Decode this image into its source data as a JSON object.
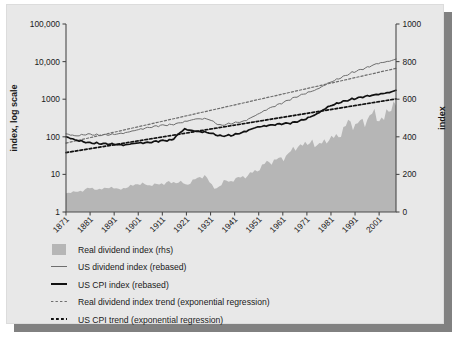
{
  "chart_data": {
    "type": "line",
    "title": "",
    "subtitle": "",
    "ylabel": "index, log scale",
    "ylabel_right": "index",
    "xlabel": "",
    "grid": false,
    "legend_position": "below",
    "y_log": true,
    "ylim": [
      1,
      100000
    ],
    "ytick_labels": [
      "100,000",
      "10,000",
      "1000",
      "100",
      "10",
      "1"
    ],
    "ytick_values": [
      100000,
      10000,
      1000,
      100,
      10,
      1
    ],
    "ylim_right": [
      0,
      1000
    ],
    "ytick_labels_right": [
      "1000",
      "800",
      "600",
      "400",
      "200",
      "0"
    ],
    "ytick_values_right": [
      1000,
      800,
      600,
      400,
      200,
      0
    ],
    "xlim": [
      1871,
      2008
    ],
    "xtick_labels": [
      "1871",
      "1881",
      "1891",
      "1901",
      "1911",
      "1921",
      "1931",
      "1941",
      "1951",
      "1961",
      "1971",
      "1981",
      "1991",
      "2001"
    ],
    "xtick_values": [
      1871,
      1881,
      1891,
      1901,
      1911,
      1921,
      1931,
      1941,
      1951,
      1961,
      1971,
      1981,
      1991,
      2001
    ],
    "series": [
      {
        "name": "Real dividend index (rhs)",
        "type": "area",
        "axis": "right",
        "color": "#b6b6b6",
        "x": [
          1871,
          1873,
          1875,
          1877,
          1879,
          1881,
          1883,
          1885,
          1887,
          1889,
          1891,
          1893,
          1895,
          1897,
          1899,
          1901,
          1903,
          1905,
          1907,
          1909,
          1911,
          1913,
          1915,
          1917,
          1919,
          1921,
          1923,
          1925,
          1927,
          1929,
          1931,
          1933,
          1935,
          1937,
          1939,
          1941,
          1943,
          1945,
          1947,
          1949,
          1951,
          1953,
          1955,
          1957,
          1959,
          1961,
          1963,
          1965,
          1967,
          1969,
          1971,
          1973,
          1975,
          1977,
          1979,
          1981,
          1983,
          1985,
          1987,
          1989,
          1991,
          1993,
          1995,
          1997,
          1999,
          2001,
          2003,
          2005,
          2007
        ],
        "values": [
          100,
          108,
          104,
          112,
          120,
          128,
          124,
          118,
          126,
          132,
          128,
          120,
          126,
          134,
          142,
          152,
          148,
          140,
          150,
          142,
          152,
          160,
          150,
          164,
          158,
          140,
          164,
          176,
          184,
          196,
          150,
          120,
          140,
          170,
          158,
          176,
          182,
          188,
          200,
          210,
          232,
          248,
          268,
          272,
          278,
          288,
          304,
          330,
          348,
          360,
          356,
          382,
          346,
          368,
          380,
          392,
          396,
          420,
          452,
          482,
          462,
          470,
          486,
          508,
          520,
          500,
          492,
          540,
          580
        ]
      },
      {
        "name": "US dividend index (rebased)",
        "type": "line",
        "axis": "left",
        "color": "#6e6e6e",
        "style": "solid",
        "width": 1,
        "x": [
          1871,
          1875,
          1880,
          1885,
          1890,
          1895,
          1900,
          1905,
          1910,
          1915,
          1920,
          1925,
          1930,
          1935,
          1940,
          1945,
          1950,
          1955,
          1960,
          1965,
          1970,
          1975,
          1980,
          1985,
          1990,
          1995,
          2000,
          2005,
          2008
        ],
        "values": [
          120,
          105,
          118,
          110,
          115,
          125,
          150,
          175,
          200,
          210,
          250,
          300,
          300,
          200,
          230,
          260,
          380,
          560,
          760,
          1050,
          1400,
          1800,
          2700,
          3700,
          5200,
          6600,
          8800,
          10200,
          11500
        ]
      },
      {
        "name": "US CPI index (rebased)",
        "type": "line",
        "axis": "left",
        "color": "#111111",
        "style": "solid",
        "width": 1.7,
        "x": [
          1871,
          1875,
          1880,
          1885,
          1890,
          1895,
          1900,
          1905,
          1910,
          1915,
          1920,
          1925,
          1930,
          1935,
          1940,
          1945,
          1950,
          1955,
          1960,
          1965,
          1970,
          1975,
          1980,
          1985,
          1990,
          1995,
          2000,
          2005,
          2008
        ],
        "values": [
          100,
          82,
          70,
          66,
          64,
          60,
          68,
          70,
          78,
          82,
          160,
          140,
          130,
          105,
          110,
          135,
          180,
          200,
          220,
          235,
          290,
          400,
          640,
          830,
          1010,
          1180,
          1330,
          1500,
          1700
        ]
      },
      {
        "name": "Real dividend index trend (exponential regression)",
        "type": "line",
        "axis": "left",
        "color": "#6e6e6e",
        "style": "dashed",
        "width": 1.2,
        "x": [
          1871,
          2008
        ],
        "values": [
          68,
          6600
        ]
      },
      {
        "name": "US CPI trend (exponential regression)",
        "type": "line",
        "axis": "left",
        "color": "#111111",
        "style": "dashed",
        "width": 1.7,
        "x": [
          1871,
          2008
        ],
        "values": [
          38,
          1020
        ]
      }
    ],
    "legend_entries": [
      {
        "label": "Real dividend index (rhs)",
        "marker": "swatch",
        "color": "#b6b6b6"
      },
      {
        "label": "US dividend index (rebased)",
        "marker": "line-thin",
        "color": "#6e6e6e"
      },
      {
        "label": "US CPI index (rebased)",
        "marker": "line-thick",
        "color": "#111111"
      },
      {
        "label": "Real dividend index trend (exponential regression)",
        "marker": "dash-thin",
        "color": "#6e6e6e"
      },
      {
        "label": "US CPI trend (exponential regression)",
        "marker": "dash-thick",
        "color": "#111111"
      }
    ],
    "colors": {
      "panel_background": "#e8e8e8",
      "plot_background": "#e8e8e8",
      "axis": "#4a4a4a",
      "text": "#1a1a1a",
      "shadow": "#818181"
    }
  }
}
